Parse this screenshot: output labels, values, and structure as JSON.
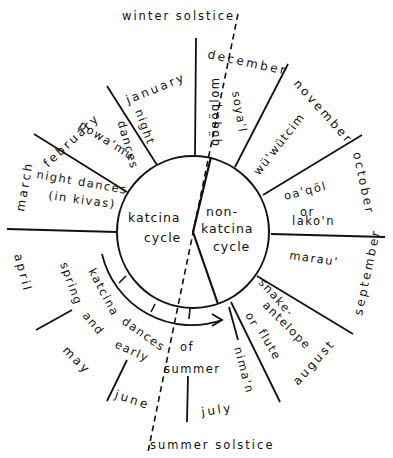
{
  "diagram": {
    "solstices": {
      "winter": "winter solstice",
      "summer": "summer solstice"
    },
    "center": {
      "left": [
        "katcina",
        "cycle"
      ],
      "right": [
        "non-",
        "katcina",
        "cycle"
      ]
    },
    "months": {
      "january": "january",
      "february": "february",
      "march": "march",
      "april": "april",
      "may": "may",
      "june": "june",
      "july": "july",
      "august": "august",
      "september": "september",
      "october": "october",
      "november": "november",
      "december": "december"
    },
    "ceremonies": {
      "qoqolom": "qöqöqlom",
      "soyal": "soya'l",
      "night_dances_jan": [
        "night",
        "dances"
      ],
      "powamu": "powa'mu",
      "night_dances_kivas": [
        "night dances",
        "(in kivas)"
      ],
      "katcina_dances": [
        "katcina",
        "dances",
        "of",
        "spring",
        "and",
        "early",
        "summer"
      ],
      "niman": "nima'n",
      "snake_flute": [
        "snake-",
        "antelope",
        "or",
        "flute"
      ],
      "marau": "marau'",
      "oaqol": [
        "oa'qöl",
        "or",
        "lako'n"
      ],
      "wuwutcim": "wü'wütcim"
    }
  }
}
